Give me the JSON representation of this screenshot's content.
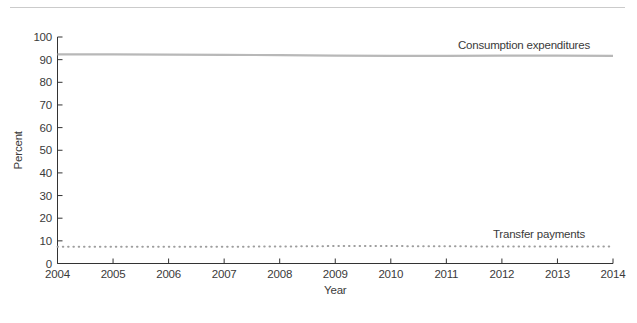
{
  "page": {
    "background": "#ffffff",
    "top_rule_color": "#cbcbcb"
  },
  "chart_data": {
    "type": "line",
    "title": "",
    "xlabel": "Year",
    "ylabel": "Percent",
    "x": [
      2004,
      2005,
      2006,
      2007,
      2008,
      2009,
      2010,
      2011,
      2012,
      2013,
      2014
    ],
    "x_tick_labels": [
      "2004",
      "2005",
      "2006",
      "2007",
      "2008",
      "2009",
      "2010",
      "2011",
      "2012",
      "2013",
      "2014"
    ],
    "y_ticks": [
      0,
      10,
      20,
      30,
      40,
      50,
      60,
      70,
      80,
      90,
      100
    ],
    "xlim": [
      2004,
      2014
    ],
    "ylim": [
      0,
      100
    ],
    "grid": false,
    "legend_position": "inline-right",
    "axis_color": "#333333",
    "text_color": "#3a3a3a",
    "series": [
      {
        "name": "Consumption expenditures",
        "style": "solid",
        "color": "#b8b8b8",
        "stroke_width": 2.2,
        "label_right_inset": 23,
        "label_dy": -7,
        "values": [
          92.3,
          92.3,
          92.2,
          92.1,
          92.0,
          91.8,
          91.7,
          91.7,
          91.8,
          91.8,
          91.7
        ]
      },
      {
        "name": "Transfer payments",
        "style": "dotted",
        "color": "#9e9e9e",
        "stroke_width": 2.0,
        "label_right_inset": 28,
        "label_dy": -9,
        "values": [
          7.4,
          7.4,
          7.4,
          7.4,
          7.5,
          7.7,
          7.7,
          7.6,
          7.5,
          7.5,
          7.5
        ]
      }
    ]
  }
}
